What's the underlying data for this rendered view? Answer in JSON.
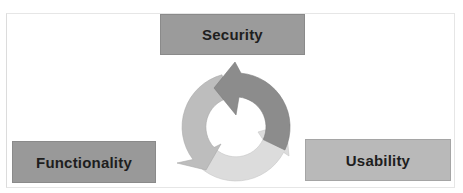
{
  "diagram": {
    "type": "cycle",
    "nodes": [
      {
        "id": "security",
        "label": "Security",
        "color": "#9b9b9b"
      },
      {
        "id": "functionality",
        "label": "Functionality",
        "color": "#999999"
      },
      {
        "id": "usability",
        "label": "Usability",
        "color": "#b9b9b9"
      }
    ],
    "cycle_arrows": [
      {
        "id": "arrow-dark",
        "color": "#8c8c8c",
        "direction": "counterclockwise",
        "from": "right",
        "to": "top"
      },
      {
        "id": "arrow-medium",
        "color": "#bdbdbd",
        "direction": "counterclockwise",
        "from": "top",
        "to": "bottom-left"
      },
      {
        "id": "arrow-light",
        "color": "#dcdcdc",
        "direction": "counterclockwise",
        "from": "bottom-left",
        "to": "right"
      }
    ],
    "frame_border_color": "#e0e0e0"
  }
}
